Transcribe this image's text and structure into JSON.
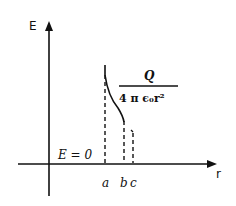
{
  "diagram": {
    "axes": {
      "y_label": "E",
      "x_label": "r"
    },
    "region_label": "E = 0",
    "formula": {
      "numerator": "Q",
      "denominator": "4 π ϵ₀r²"
    },
    "markers": [
      {
        "label": "a"
      },
      {
        "label": "b"
      },
      {
        "label": "c"
      }
    ],
    "colors": {
      "ink": "#111111",
      "background": "#ffffff"
    }
  }
}
